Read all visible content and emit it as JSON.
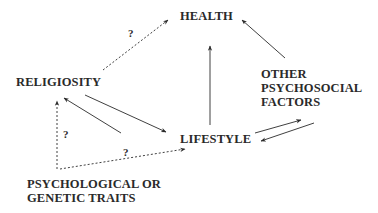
{
  "diagram": {
    "nodes": {
      "health": "HEALTH",
      "religiosity": "RELIGIOSITY",
      "lifestyle": "LIFESTYLE",
      "other": [
        "OTHER",
        "PSYCHOSOCIAL",
        "FACTORS"
      ],
      "traits": [
        "PSYCHOLOGICAL OR",
        "GENETIC TRAITS"
      ]
    },
    "edge_labels": {
      "religiosity_health": "?",
      "traits_religiosity": "?",
      "traits_lifestyle": "?"
    },
    "edges": [
      {
        "from": "RELIGIOSITY",
        "to": "HEALTH",
        "style": "dotted",
        "label": "?"
      },
      {
        "from": "LIFESTYLE",
        "to": "HEALTH",
        "style": "solid"
      },
      {
        "from": "OTHER PSYCHOSOCIAL FACTORS",
        "to": "HEALTH",
        "style": "solid"
      },
      {
        "from": "RELIGIOSITY",
        "to": "LIFESTYLE",
        "style": "solid"
      },
      {
        "from": "LIFESTYLE",
        "to": "RELIGIOSITY",
        "style": "solid"
      },
      {
        "from": "LIFESTYLE",
        "to": "OTHER PSYCHOSOCIAL FACTORS",
        "style": "solid"
      },
      {
        "from": "OTHER PSYCHOSOCIAL FACTORS",
        "to": "LIFESTYLE",
        "style": "solid"
      },
      {
        "from": "PSYCHOLOGICAL OR GENETIC TRAITS",
        "to": "RELIGIOSITY",
        "style": "dotted",
        "label": "?"
      },
      {
        "from": "PSYCHOLOGICAL OR GENETIC TRAITS",
        "to": "LIFESTYLE",
        "style": "dotted",
        "label": "?"
      }
    ],
    "colors": {
      "ink": "#2a2a2a",
      "background": "#ffffff"
    }
  }
}
